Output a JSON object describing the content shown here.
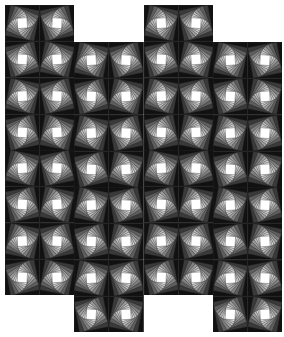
{
  "figure": {
    "background": "#ffffff",
    "stroke": "#222222",
    "shades": [
      "#111111",
      "#3a3a3a",
      "#5e5e5e",
      "#808080",
      "#9e9e9e",
      "#bdbdbd",
      "#d8d8d8",
      "#f2f2f2",
      "#ffffff"
    ],
    "tile_width": 69.3,
    "tile_height": 72.5,
    "columns": [
      {
        "x": 5,
        "y": 5,
        "rows": 4
      },
      {
        "x": 74.3,
        "y": 42,
        "rows": 4
      },
      {
        "x": 143.6,
        "y": 5,
        "rows": 4
      },
      {
        "x": 212.9,
        "y": 42,
        "rows": 4
      }
    ]
  }
}
